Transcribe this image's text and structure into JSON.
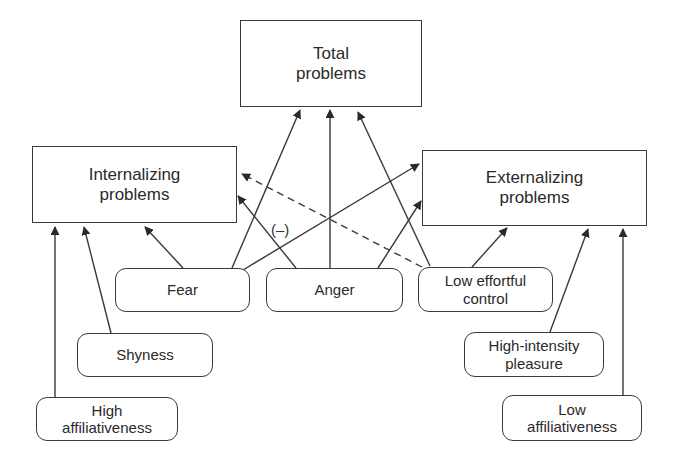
{
  "diagram": {
    "outcomes": [
      {
        "id": "total",
        "lines": [
          "Total",
          "problems"
        ]
      },
      {
        "id": "internalizing",
        "lines": [
          "Internalizing",
          "problems"
        ]
      },
      {
        "id": "externalizing",
        "lines": [
          "Externalizing",
          "problems"
        ]
      }
    ],
    "traits": [
      {
        "id": "fear",
        "lines": [
          "Fear"
        ]
      },
      {
        "id": "anger",
        "lines": [
          "Anger"
        ]
      },
      {
        "id": "low_effortful_control",
        "lines": [
          "Low effortful",
          "control"
        ]
      },
      {
        "id": "shyness",
        "lines": [
          "Shyness"
        ]
      },
      {
        "id": "high_intensity_pleasure",
        "lines": [
          "High-intensity",
          "pleasure"
        ]
      },
      {
        "id": "high_affiliativeness",
        "lines": [
          "High",
          "affiliativeness"
        ]
      },
      {
        "id": "low_affiliativeness",
        "lines": [
          "Low",
          "affiliativeness"
        ]
      }
    ],
    "edges": [
      {
        "from": "fear",
        "to": "internalizing",
        "style": "solid"
      },
      {
        "from": "fear",
        "to": "total",
        "style": "solid"
      },
      {
        "from": "fear",
        "to": "externalizing",
        "style": "solid"
      },
      {
        "from": "anger",
        "to": "internalizing",
        "style": "solid"
      },
      {
        "from": "anger",
        "to": "total",
        "style": "solid"
      },
      {
        "from": "anger",
        "to": "externalizing",
        "style": "solid"
      },
      {
        "from": "low_effortful_control",
        "to": "total",
        "style": "solid"
      },
      {
        "from": "low_effortful_control",
        "to": "externalizing",
        "style": "solid"
      },
      {
        "from": "low_effortful_control",
        "to": "internalizing",
        "style": "dashed",
        "label": "(–)"
      },
      {
        "from": "shyness",
        "to": "internalizing",
        "style": "solid"
      },
      {
        "from": "high_affiliativeness",
        "to": "internalizing",
        "style": "solid"
      },
      {
        "from": "high_intensity_pleasure",
        "to": "externalizing",
        "style": "solid"
      },
      {
        "from": "low_affiliativeness",
        "to": "externalizing",
        "style": "solid"
      }
    ],
    "negative_label": "(–)"
  }
}
